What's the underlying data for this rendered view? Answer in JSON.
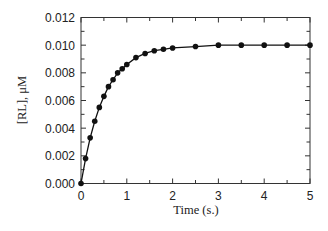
{
  "chart_data": {
    "type": "line",
    "title": "",
    "xlabel": "Time (s.)",
    "ylabel": "[RL], μM",
    "xlim": [
      0,
      5
    ],
    "ylim": [
      0,
      0.012
    ],
    "x_ticks": [
      "0",
      "1",
      "2",
      "3",
      "4",
      "5"
    ],
    "y_ticks": [
      "0.000",
      "0.002",
      "0.004",
      "0.006",
      "0.008",
      "0.010",
      "0.012"
    ],
    "grid": false,
    "legend": null,
    "markers": "filled-circle",
    "series": [
      {
        "name": "[RL]",
        "x": [
          0,
          0.1,
          0.2,
          0.3,
          0.4,
          0.5,
          0.6,
          0.7,
          0.8,
          0.9,
          1.0,
          1.2,
          1.4,
          1.6,
          1.8,
          2.0,
          2.5,
          3.0,
          3.5,
          4.0,
          4.5,
          5.0
        ],
        "y": [
          0.0,
          0.0018,
          0.0033,
          0.0045,
          0.0055,
          0.0063,
          0.007,
          0.0075,
          0.008,
          0.0083,
          0.0086,
          0.0091,
          0.0094,
          0.0096,
          0.0097,
          0.0098,
          0.0099,
          0.01,
          0.01,
          0.01,
          0.01,
          0.01
        ]
      }
    ]
  },
  "labels": {
    "xlabel": "Time (s.)",
    "ylabel": "[RL], μM"
  }
}
